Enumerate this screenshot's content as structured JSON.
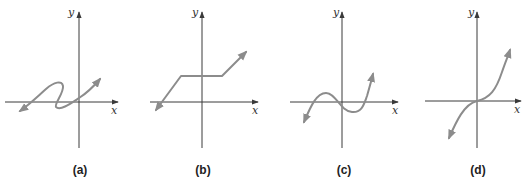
{
  "figure": {
    "axis_x_label": "x",
    "axis_y_label": "y",
    "colors": {
      "axis": "#3a3a3a",
      "curve": "#8c8c8c",
      "background": "#ffffff"
    },
    "panels": [
      {
        "id": "a",
        "label": "(a)",
        "description": "S-shaped curve that folds back on itself (not a function)"
      },
      {
        "id": "b",
        "label": "(b)",
        "description": "Piecewise linear: rising line, horizontal segment, rising line"
      },
      {
        "id": "c",
        "label": "(c)",
        "description": "Cubic-like curve with a local max and a local min"
      },
      {
        "id": "d",
        "label": "(d)",
        "description": "Increasing cubic curve through the origin"
      }
    ]
  }
}
